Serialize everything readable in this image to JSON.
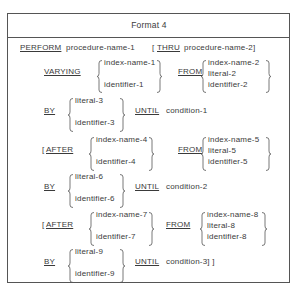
{
  "title": "Format 4",
  "perform_line": {
    "keyword": "PERFORM",
    "operand": "procedure-name-1",
    "optional_open": "[",
    "thru_keyword": "THRU",
    "thru_operand": "procedure-name-2]"
  },
  "varying": {
    "keyword": "VARYING",
    "choices": [
      "index-name-1",
      "identifier-1"
    ],
    "from_keyword": "FROM",
    "from_choices": [
      "index-name-2",
      "literal-2",
      "identifier-2"
    ]
  },
  "by_1": {
    "keyword": "BY",
    "choices": [
      "literal-3",
      "identifier-3"
    ],
    "until_keyword": "UNTIL",
    "condition": "condition-1"
  },
  "after_1": {
    "open": "[",
    "keyword": "AFTER",
    "choices": [
      "index-name-4",
      "identifier-4"
    ],
    "from_keyword": "FROM",
    "from_choices": [
      "index-name-5",
      "literal-5",
      "identifier-5"
    ]
  },
  "by_2": {
    "keyword": "BY",
    "choices": [
      "literal-6",
      "identifier-6"
    ],
    "until_keyword": "UNTIL",
    "condition": "condition-2"
  },
  "after_2": {
    "open": "[",
    "keyword": "AFTER",
    "choices": [
      "index-name-7",
      "identifier-7"
    ],
    "from_keyword": "FROM",
    "from_choices": [
      "index-name-8",
      "literal-8",
      "identifier-8"
    ]
  },
  "by_3": {
    "keyword": "BY",
    "choices": [
      "literal-9",
      "identifier-9"
    ],
    "until_keyword": "UNTIL",
    "condition": "condition-3] ]"
  }
}
